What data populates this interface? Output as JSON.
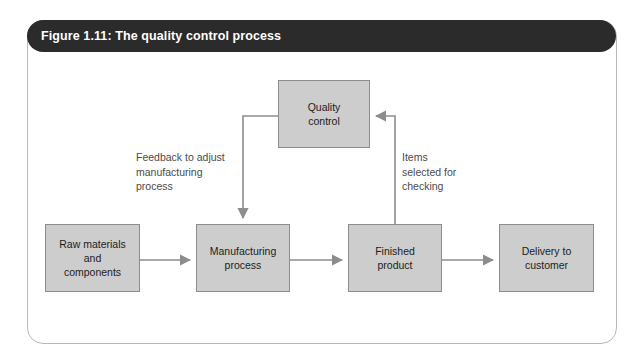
{
  "figure": {
    "title": "Figure 1.11: The quality control process",
    "title_bar_color": "#2b2b2b",
    "title_text_color": "#ffffff",
    "card_border_color": "#b9b9b9",
    "card_background": "#ffffff"
  },
  "diagram": {
    "type": "flowchart",
    "node_fill": "#cdcdcd",
    "node_border": "#8d8d8d",
    "connector_color": "#8d8d8d",
    "nodes": [
      {
        "id": "quality-control",
        "label": "Quality\ncontrol",
        "x": 278,
        "y": 80,
        "w": 92,
        "h": 68
      },
      {
        "id": "raw-materials",
        "label": "Raw materials\nand\ncomponents",
        "x": 45,
        "y": 224,
        "w": 95,
        "h": 68
      },
      {
        "id": "manufacturing-process",
        "label": "Manufacturing\nprocess",
        "x": 196,
        "y": 224,
        "w": 94,
        "h": 68
      },
      {
        "id": "finished-product",
        "label": "Finished\nproduct",
        "x": 348,
        "y": 224,
        "w": 94,
        "h": 68
      },
      {
        "id": "delivery-to-customer",
        "label": "Delivery to\ncustomer",
        "x": 499,
        "y": 224,
        "w": 95,
        "h": 68
      }
    ],
    "annotations": [
      {
        "id": "feedback-annotation",
        "text": "Feedback to adjust\nmanufacturing\nprocess",
        "x": 136,
        "y": 150
      },
      {
        "id": "items-annotation",
        "text": "Items\nselected for\nchecking",
        "x": 402,
        "y": 150
      }
    ],
    "connectors": [
      {
        "id": "raw-to-manufacturing",
        "from": "raw-materials",
        "to": "manufacturing-process"
      },
      {
        "id": "manufacturing-to-finished",
        "from": "manufacturing-process",
        "to": "finished-product"
      },
      {
        "id": "finished-to-delivery",
        "from": "finished-product",
        "to": "delivery-to-customer"
      },
      {
        "id": "finished-to-quality-control",
        "from": "finished-product",
        "to": "quality-control"
      },
      {
        "id": "quality-control-to-manufacturing",
        "from": "quality-control",
        "to": "manufacturing-process"
      }
    ]
  }
}
